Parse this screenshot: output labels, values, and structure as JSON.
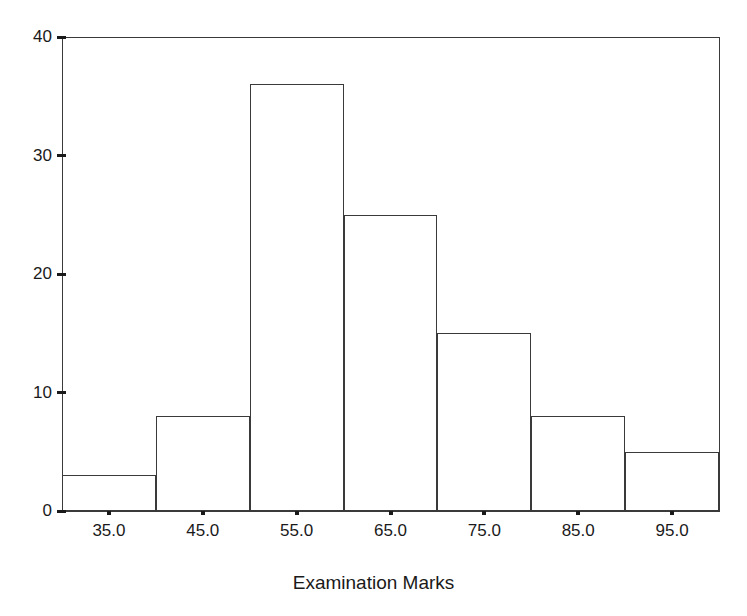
{
  "chart_data": {
    "type": "bar",
    "title": "",
    "subtitle": "",
    "xlabel": "Examination Marks",
    "ylabel": "",
    "categories": [
      "35.0",
      "45.0",
      "55.0",
      "65.0",
      "75.0",
      "85.0",
      "95.0"
    ],
    "values": [
      3,
      8,
      36,
      25,
      15,
      8,
      5
    ],
    "bin_edges": [
      30,
      40,
      50,
      60,
      70,
      80,
      90,
      100
    ],
    "bin_width": 10,
    "xlim": [
      30,
      100
    ],
    "ylim": [
      0,
      40
    ],
    "x_tick_labels": [
      "35.0",
      "45.0",
      "55.0",
      "65.0",
      "75.0",
      "95.0"
    ],
    "y_tick_labels": [
      "0",
      "10",
      "20",
      "30",
      "40"
    ],
    "y_ticks": [
      0,
      10,
      20,
      30,
      40
    ],
    "grid": false,
    "legend": false,
    "legend_position": "none",
    "bar_fill": "#ffffff",
    "bar_stroke": "#3a3a3a",
    "axis_color": "#3a3a3a",
    "background": "#ffffff",
    "series": [
      {
        "name": "Frequency",
        "values": [
          3,
          8,
          36,
          25,
          15,
          8,
          5
        ]
      }
    ]
  },
  "axes": {
    "x": {
      "title": "Examination Marks",
      "ticks": [
        {
          "label": "35.0",
          "value": 35
        },
        {
          "label": "45.0",
          "value": 45
        },
        {
          "label": "55.0",
          "value": 55
        },
        {
          "label": "65.0",
          "value": 65
        },
        {
          "label": "75.0",
          "value": 75
        },
        {
          "label": "85.0",
          "value": 85
        },
        {
          "label": "95.0",
          "value": 95
        }
      ]
    },
    "y": {
      "title": "",
      "ticks": [
        {
          "label": "0",
          "value": 0
        },
        {
          "label": "10",
          "value": 10
        },
        {
          "label": "20",
          "value": 20
        },
        {
          "label": "30",
          "value": 30
        },
        {
          "label": "40",
          "value": 40
        }
      ]
    }
  },
  "bars": [
    {
      "center": "35.0",
      "value": 3
    },
    {
      "center": "45.0",
      "value": 8
    },
    {
      "center": "55.0",
      "value": 36
    },
    {
      "center": "65.0",
      "value": 25
    },
    {
      "center": "75.0",
      "value": 15
    },
    {
      "center": "85.0",
      "value": 8
    },
    {
      "center": "95.0",
      "value": 5
    }
  ]
}
